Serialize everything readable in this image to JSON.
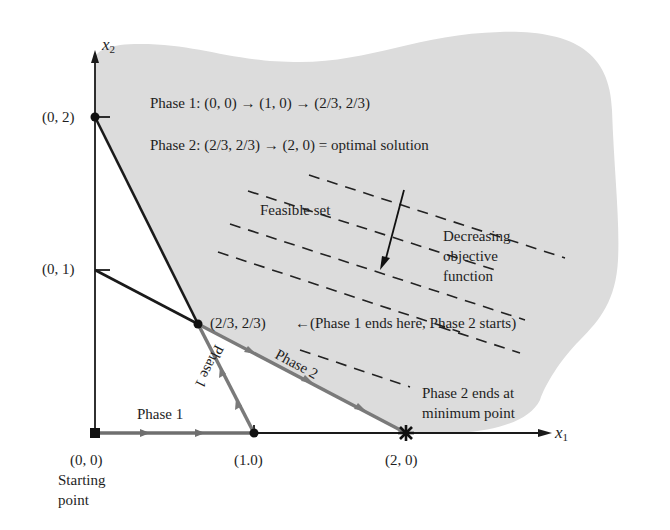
{
  "figure": {
    "axes": {
      "x_label": "x",
      "x_sub": "1",
      "y_label": "x",
      "y_sub": "2"
    },
    "points": {
      "origin": "(0, 0)",
      "origin_note_1": "Starting",
      "origin_note_2": "point",
      "p10": "(1.0)",
      "p20": "(2, 0)",
      "p01": "(0, 1)",
      "p02": "(0, 2)",
      "p2323": "(2/3, 2/3)"
    },
    "annotations": {
      "phase1_summary": "Phase 1:  (0, 0) → (1, 0) → (2/3, 2/3)",
      "phase2_summary": "Phase 2:  (2/3, 2/3) → (2, 0)  =  optimal solution",
      "feasible_set": "Feasible set",
      "decreasing_1": "Decreasing",
      "decreasing_2": "objective",
      "decreasing_3": "function",
      "phase1_ends": "←(Phase 1 ends here,  Phase 2 starts)",
      "phase2_ends_1": "Phase 2 ends at",
      "phase2_ends_2": "minimum point",
      "phase1_horizontal": "Phase 1",
      "phase1_slanted": "Phase 1",
      "phase2_slanted": "Phase 2"
    },
    "colors": {
      "feasible_fill": "#dcdcdc",
      "path_gray": "#7a7a7a",
      "ink": "#1a1a1a"
    }
  }
}
